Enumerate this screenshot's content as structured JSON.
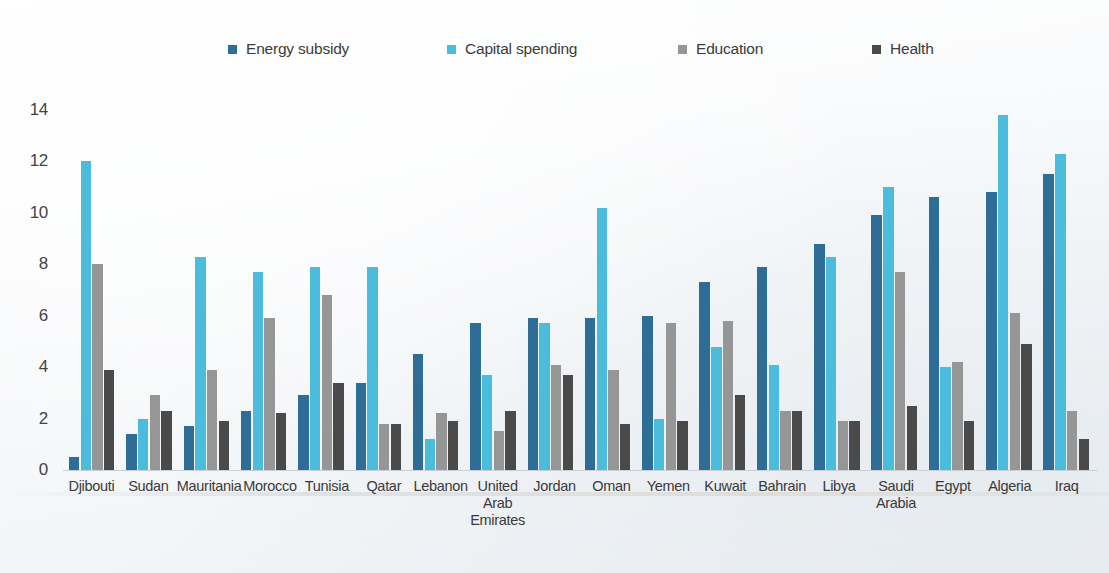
{
  "colors": {
    "energy_subsidy": "#2E6D96",
    "capital_spending": "#4CBCDC",
    "education": "#969696",
    "health": "#4A4A4A",
    "background": "#FFFFFF",
    "axis_text": "#3A3A3A",
    "baseline": "#C9CFD4"
  },
  "legend": {
    "items": [
      {
        "label": "Energy subsidy",
        "color_key": "energy_subsidy",
        "left_px": 228
      },
      {
        "label": "Capital spending",
        "color_key": "capital_spending",
        "left_px": 447
      },
      {
        "label": "Education",
        "color_key": "education",
        "left_px": 678
      },
      {
        "label": "Health",
        "color_key": "health",
        "left_px": 872
      }
    ]
  },
  "axes": {
    "y_ticks": [
      "0",
      "2",
      "4",
      "6",
      "8",
      "10",
      "12",
      "14"
    ],
    "y_min": 0,
    "y_max": 14
  },
  "chart_data": {
    "type": "bar",
    "title": "",
    "subtitle": "",
    "xlabel": "",
    "ylabel": "",
    "ylim": [
      0,
      14
    ],
    "grid": false,
    "legend_position": "top",
    "categories": [
      "Djibouti",
      "Sudan",
      "Mauritania",
      "Morocco",
      "Tunisia",
      "Qatar",
      "Lebanon",
      "United\nArab\nEmirates",
      "Jordan",
      "Oman",
      "Yemen",
      "Kuwait",
      "Bahrain",
      "Libya",
      "Saudi\nArabia",
      "Egypt",
      "Algeria",
      "Iraq"
    ],
    "series": [
      {
        "name": "Energy subsidy",
        "color": "#2E6D96",
        "values": [
          0.5,
          1.4,
          1.7,
          2.3,
          2.9,
          3.4,
          4.5,
          5.7,
          5.9,
          5.9,
          6.0,
          7.3,
          7.9,
          8.8,
          9.9,
          10.6,
          10.8,
          11.5
        ]
      },
      {
        "name": "Capital spending",
        "color": "#4CBCDC",
        "values": [
          12.0,
          2.0,
          8.3,
          7.7,
          7.9,
          7.9,
          1.2,
          3.7,
          5.7,
          10.2,
          2.0,
          4.8,
          4.1,
          8.3,
          11.0,
          4.0,
          13.8,
          12.3
        ]
      },
      {
        "name": "Education",
        "color": "#969696",
        "values": [
          8.0,
          2.9,
          3.9,
          5.9,
          6.8,
          1.8,
          2.2,
          1.5,
          4.1,
          3.9,
          5.7,
          5.8,
          2.3,
          1.9,
          7.7,
          4.2,
          6.1,
          2.3
        ]
      },
      {
        "name": "Health",
        "color": "#4A4A4A",
        "values": [
          3.9,
          2.3,
          1.9,
          2.2,
          3.4,
          1.8,
          1.9,
          2.3,
          3.7,
          1.8,
          1.9,
          2.9,
          2.3,
          1.9,
          2.5,
          1.9,
          4.9,
          1.2
        ]
      }
    ]
  }
}
